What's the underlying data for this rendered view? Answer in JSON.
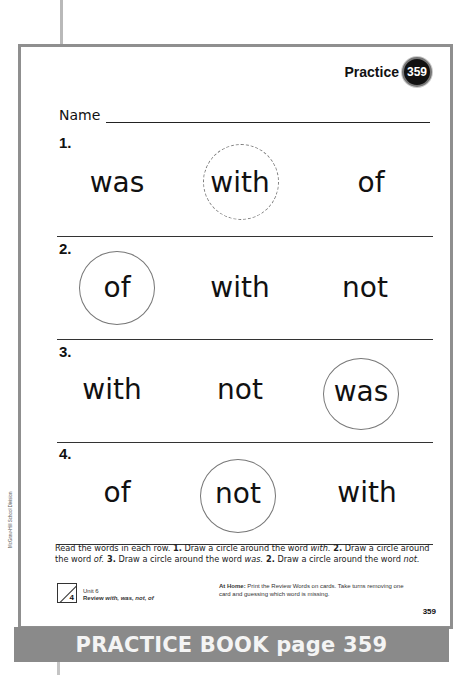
{
  "header": {
    "practice_label": "Practice",
    "practice_number": "359"
  },
  "name_field": {
    "label": "Name",
    "value": ""
  },
  "rows": [
    {
      "number": "1.",
      "words": [
        "was",
        "with",
        "of"
      ],
      "circled_index": 1,
      "circled_word": "with"
    },
    {
      "number": "2.",
      "words": [
        "of",
        "with",
        "not"
      ],
      "circled_index": 0,
      "circled_word": "of"
    },
    {
      "number": "3.",
      "words": [
        "with",
        "not",
        "was"
      ],
      "circled_index": 2,
      "circled_word": "was"
    },
    {
      "number": "4.",
      "words": [
        "of",
        "not",
        "with"
      ],
      "circled_index": 1,
      "circled_word": "not"
    }
  ],
  "instructions": {
    "intro": "Read the words in each row. ",
    "step1_num": "1.",
    "step1_text": " Draw a circle around the word ",
    "step1_word": "with.",
    "step2_num": " 2.",
    "step2_text": " Draw a circle around the word ",
    "step2_word": "of.",
    "step3_num": " 3.",
    "step3_text": " Draw a circle around the word ",
    "step3_word": "was.",
    "step4_num": " 2.",
    "step4_text": " Draw a circle around the word ",
    "step4_word": "not."
  },
  "footer": {
    "unit_number": "4",
    "unit_label": "Unit 6",
    "review_prefix": "Review ",
    "review_words": "with, was, not, of",
    "at_home_label": "At Home:",
    "at_home_text": " Print the Review Words on cards. Take turns removing one card and guessing which word is missing.",
    "page_number": "359",
    "credit": "McGraw-Hill School Division"
  },
  "banner": {
    "text": "PRACTICE BOOK page 359"
  },
  "colors": {
    "border": "#8f8f8f",
    "banner_bg": "#8a8a8a",
    "banner_text": "#f4f4f4",
    "badge_bg": "#111111",
    "circle_stroke": "#777777"
  }
}
